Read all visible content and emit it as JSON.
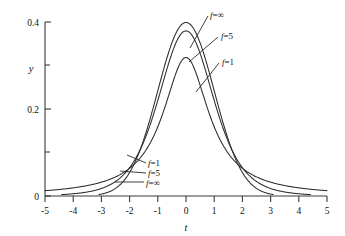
{
  "chart_data": {
    "type": "line",
    "title": "",
    "xlabel": "t",
    "ylabel": "y",
    "xlim": [
      -5,
      5
    ],
    "ylim": [
      0,
      0.4
    ],
    "grid": false,
    "legend_position": "inline-callouts",
    "x_ticks": [
      -5,
      -4,
      -3,
      -2,
      -1,
      0,
      1,
      2,
      3,
      4,
      5
    ],
    "x_tick_labels": [
      "-5",
      "-4",
      "-3",
      "-2",
      "-1",
      "0",
      "1",
      "2",
      "3",
      "4",
      "5"
    ],
    "y_ticks": [
      0,
      0.1,
      0.2,
      0.3,
      0.4
    ],
    "y_tick_labels": [
      "0",
      "",
      "0.2",
      "",
      "0.4"
    ],
    "x": [
      -5,
      -4.75,
      -4.5,
      -4.25,
      -4,
      -3.75,
      -3.5,
      -3.25,
      -3,
      -2.75,
      -2.5,
      -2.25,
      -2,
      -1.75,
      -1.5,
      -1.25,
      -1,
      -0.75,
      -0.5,
      -0.25,
      0,
      0.25,
      0.5,
      0.75,
      1,
      1.25,
      1.5,
      1.75,
      2,
      2.25,
      2.5,
      2.75,
      3,
      3.25,
      3.5,
      3.75,
      4,
      4.25,
      4.5,
      4.75,
      5
    ],
    "series": [
      {
        "name": "f=1",
        "label": "f=1",
        "degrees_of_freedom": 1,
        "peak": 0.3183,
        "values": [
          0.0122,
          0.0135,
          0.015,
          0.0167,
          0.0187,
          0.0211,
          0.024,
          0.0275,
          0.0318,
          0.0372,
          0.0439,
          0.0525,
          0.0637,
          0.0783,
          0.0979,
          0.1244,
          0.1592,
          0.2037,
          0.2546,
          0.2996,
          0.3183,
          0.2996,
          0.2546,
          0.2037,
          0.1592,
          0.1244,
          0.0979,
          0.0783,
          0.0637,
          0.0525,
          0.0439,
          0.0372,
          0.0318,
          0.0275,
          0.024,
          0.0211,
          0.0187,
          0.0167,
          0.015,
          0.0135,
          0.0122
        ]
      },
      {
        "name": "f=5",
        "label": "f=5",
        "degrees_of_freedom": 5,
        "peak": 0.3796,
        "values": [
          0.002,
          0.0024,
          0.003,
          0.0038,
          0.0048,
          0.0062,
          0.0081,
          0.0107,
          0.0144,
          0.0197,
          0.0272,
          0.0381,
          0.054,
          0.0769,
          0.1095,
          0.1543,
          0.213,
          0.2838,
          0.3559,
          0.4105,
          0.3796,
          0.4105,
          0.3559,
          0.2838,
          0.213,
          0.1543,
          0.1095,
          0.0769,
          0.054,
          0.0381,
          0.0272,
          0.0197,
          0.0144,
          0.0107,
          0.0081,
          0.0062,
          0.0048,
          0.0038,
          0.003,
          0.0024,
          0.002
        ]
      },
      {
        "name": "f=inf",
        "label": "f=∞",
        "degrees_of_freedom": "∞",
        "peak": 0.3989,
        "values": [
          1.5e-06,
          3.5e-06,
          8e-06,
          1.77e-05,
          0.0001338,
          0.0002384,
          0.0008727,
          0.0020374,
          0.0044318,
          0.0090936,
          0.0175283,
          0.0316644,
          0.053991,
          0.0862773,
          0.1295176,
          0.1826491,
          0.2419707,
          0.3011374,
          0.3520653,
          0.3866681,
          0.3989423,
          0.3866681,
          0.3520653,
          0.3011374,
          0.2419707,
          0.1826491,
          0.1295176,
          0.0862773,
          0.053991,
          0.0316644,
          0.0175283,
          0.0090936,
          0.0044318,
          0.0020374,
          0.0008727,
          0.0002384,
          0.0001338,
          1.77e-05,
          8e-06,
          3.5e-06,
          1.5e-06
        ]
      }
    ],
    "annotations": [
      {
        "id": "top-f-inf",
        "text": "f=∞",
        "group": "upper-right"
      },
      {
        "id": "top-f-5",
        "text": "f=5",
        "group": "upper-right"
      },
      {
        "id": "top-f-1",
        "text": "f=1",
        "group": "upper-right"
      },
      {
        "id": "tail-f-1",
        "text": "f=1",
        "group": "lower-left"
      },
      {
        "id": "tail-f-5",
        "text": "f=5",
        "group": "lower-left"
      },
      {
        "id": "tail-f-inf",
        "text": "f=∞",
        "group": "lower-left"
      }
    ],
    "colors": {
      "curve": "#2b2b2b",
      "axis": "#3a3a3a",
      "background": "#ffffff"
    }
  },
  "axes": {
    "y_label": "y",
    "x_label": "t",
    "y_tick_0": "0",
    "y_tick_02": "0.2",
    "y_tick_04": "0.4",
    "x_tick_m5": "-5",
    "x_tick_m4": "-4",
    "x_tick_m3": "-3",
    "x_tick_m2": "-2",
    "x_tick_m1": "-1",
    "x_tick_0": "0",
    "x_tick_1": "1",
    "x_tick_2": "2",
    "x_tick_3": "3",
    "x_tick_4": "4",
    "x_tick_5": "5"
  },
  "callouts": {
    "top_inf_f": "f",
    "top_inf_eq": "=∞",
    "top_5_f": "f",
    "top_5_eq": "=5",
    "top_1_f": "f",
    "top_1_eq": "=1",
    "tail_1_f": "f",
    "tail_1_eq": "=1",
    "tail_5_f": "f",
    "tail_5_eq": "=5",
    "tail_inf_f": "f",
    "tail_inf_eq": "=∞"
  }
}
